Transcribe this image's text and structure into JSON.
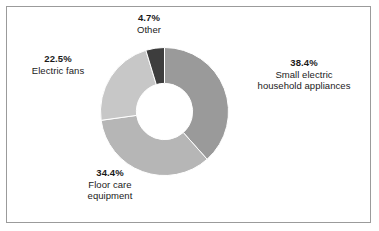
{
  "figure": {
    "background_color": "#ffffff",
    "border_color": "#9b9b9b"
  },
  "chart_data": {
    "type": "pie",
    "variant": "donut",
    "title": "",
    "subtitle": "",
    "xlabel": "",
    "ylabel": "",
    "legend_position": "none",
    "labels_position": "outside-callout",
    "grid": false,
    "start_angle_deg": 0,
    "direction": "clockwise",
    "inner_radius_ratio": 0.44,
    "categories": [
      "Small electric household appliances",
      "Floor care equipment",
      "Electric fans",
      "Other"
    ],
    "values": [
      38.4,
      34.4,
      22.5,
      4.7
    ],
    "value_suffix": "%",
    "colors": [
      "#9a9a9a",
      "#b6b6b6",
      "#c7c7c7",
      "#3d3d3d"
    ],
    "slice_separator_color": "#ffffff",
    "slices": [
      {
        "name": "Small electric household appliances",
        "percent": 38.4,
        "percent_label": "38.4%",
        "label_lines": [
          "Small electric",
          "household appliances"
        ],
        "color": "#9a9a9a",
        "start_deg": 0,
        "end_deg": 138.24
      },
      {
        "name": "Floor care equipment",
        "percent": 34.4,
        "percent_label": "34.4%",
        "label_lines": [
          "Floor care",
          "equipment"
        ],
        "color": "#b6b6b6",
        "start_deg": 138.24,
        "end_deg": 262.08
      },
      {
        "name": "Electric fans",
        "percent": 22.5,
        "percent_label": "22.5%",
        "label_lines": [
          "Electric fans"
        ],
        "color": "#c7c7c7",
        "start_deg": 262.08,
        "end_deg": 343.08
      },
      {
        "name": "Other",
        "percent": 4.7,
        "percent_label": "4.7%",
        "label_lines": [
          "Other"
        ],
        "color": "#3d3d3d",
        "start_deg": 343.08,
        "end_deg": 360
      }
    ]
  },
  "callouts": {
    "other": {
      "percent": "4.7%",
      "line1": "Other"
    },
    "appliances": {
      "percent": "38.4%",
      "line1": "Small electric",
      "line2": "household appliances"
    },
    "fans": {
      "percent": "22.5%",
      "line1": "Electric fans"
    },
    "floor": {
      "percent": "34.4%",
      "line1": "Floor care",
      "line2": "equipment"
    }
  }
}
